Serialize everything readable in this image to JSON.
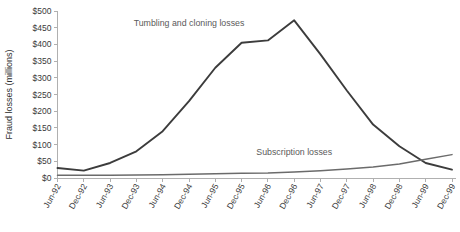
{
  "chart_data": {
    "type": "line",
    "title": "",
    "xlabel": "",
    "ylabel": "Fraud losses (millions)",
    "ylim": [
      0,
      500
    ],
    "ytick_values": [
      0,
      50,
      100,
      150,
      200,
      250,
      300,
      350,
      400,
      450,
      500
    ],
    "ytick_labels": [
      "$0",
      "$50",
      "$100",
      "$150",
      "$200",
      "$250",
      "$300",
      "$350",
      "$400",
      "$450",
      "$500"
    ],
    "grid": false,
    "legend_position": "inline-annotation",
    "categories": [
      "Jun-92",
      "Dec-92",
      "Jun-93",
      "Dec-93",
      "Jun-94",
      "Dec-94",
      "Jun-95",
      "Dec-95",
      "Jun-96",
      "Dec-96",
      "Jun-97",
      "Dec-97",
      "Jun-98",
      "Dec-98",
      "Jun-99",
      "Dec-99"
    ],
    "series": [
      {
        "name": "Tumbling and cloning losses",
        "color": "#3c3c3c",
        "values": [
          30,
          22,
          45,
          80,
          140,
          230,
          330,
          405,
          412,
          472,
          370,
          262,
          160,
          95,
          45,
          25
        ]
      },
      {
        "name": "Subscription losses",
        "color": "#6b6b6b",
        "values": [
          8,
          8,
          8,
          9,
          10,
          11,
          13,
          14,
          15,
          18,
          22,
          27,
          33,
          42,
          56,
          70
        ]
      }
    ],
    "annotations": [
      {
        "text": "Tumbling and cloning losses",
        "x_category": "Dec-94",
        "y_value": 455
      },
      {
        "text": "Subscription losses",
        "x_category": "Dec-96",
        "y_value": 70
      }
    ]
  }
}
